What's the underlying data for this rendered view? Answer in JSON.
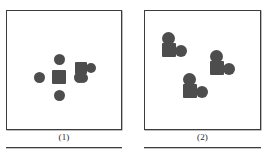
{
  "figure": {
    "type": "molecular-diagram",
    "fill_color": "#4d4d4d",
    "border_color": "#3c3c3c",
    "background_color": "#ffffff",
    "panels": [
      {
        "id": "panel-1",
        "caption": "(1)",
        "molecules": [
          {
            "name": "cross-molecule",
            "description": "central square with four circles arranged in a plus/cross pattern",
            "atoms": [
              {
                "shape": "circle",
                "x": 25,
                "y": 5,
                "size": 11
              },
              {
                "shape": "circle",
                "x": 25,
                "y": 41,
                "size": 11
              },
              {
                "shape": "circle",
                "x": 5,
                "y": 23,
                "size": 11
              },
              {
                "shape": "circle",
                "x": 45,
                "y": 23,
                "size": 11
              },
              {
                "shape": "square",
                "x": 23,
                "y": 21,
                "size": 14
              }
            ]
          },
          {
            "name": "angular-molecule",
            "description": "square with one circle to the right and one circle below-right",
            "atoms": [
              {
                "shape": "square",
                "x": 0,
                "y": 0,
                "size": 12
              },
              {
                "shape": "circle",
                "x": 11,
                "y": 1,
                "size": 10
              },
              {
                "shape": "circle",
                "x": 3,
                "y": 11,
                "size": 10
              }
            ]
          }
        ]
      },
      {
        "id": "panel-2",
        "caption": "(2)",
        "molecules": [
          {
            "name": "bent-molecule-top-left",
            "description": "circle above a square with a circle to the lower right",
            "atoms": [
              {
                "shape": "circle",
                "x": 1,
                "y": 0,
                "size": 13
              },
              {
                "shape": "square",
                "x": 1,
                "y": 11,
                "size": 14
              },
              {
                "shape": "circle",
                "x": 14,
                "y": 13,
                "size": 12
              }
            ]
          },
          {
            "name": "bent-molecule-right",
            "description": "circle above a square with a circle to the lower right",
            "atoms": [
              {
                "shape": "circle",
                "x": 1,
                "y": 0,
                "size": 13
              },
              {
                "shape": "square",
                "x": 1,
                "y": 11,
                "size": 14
              },
              {
                "shape": "circle",
                "x": 14,
                "y": 13,
                "size": 12
              }
            ]
          },
          {
            "name": "bent-molecule-bottom-center",
            "description": "circle above a square with a circle to the lower right",
            "atoms": [
              {
                "shape": "circle",
                "x": 1,
                "y": 0,
                "size": 13
              },
              {
                "shape": "square",
                "x": 1,
                "y": 11,
                "size": 14
              },
              {
                "shape": "circle",
                "x": 14,
                "y": 13,
                "size": 12
              }
            ]
          }
        ]
      }
    ]
  }
}
